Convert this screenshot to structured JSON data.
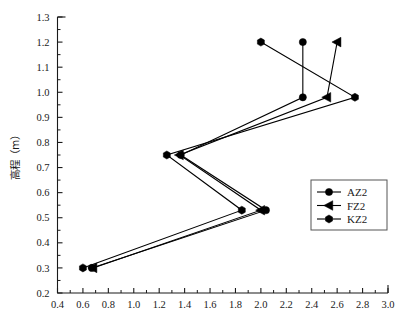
{
  "chart_data": {
    "type": "line",
    "title": "",
    "xlabel": "",
    "ylabel": "高程（m）",
    "xlim": [
      0.4,
      3.0
    ],
    "ylim": [
      0.2,
      1.3
    ],
    "x_ticks": [
      "0.4",
      "0.6",
      "0.8",
      "1.0",
      "1.2",
      "1.4",
      "1.6",
      "1.8",
      "2.0",
      "2.2",
      "2.4",
      "2.6",
      "2.8",
      "3.0"
    ],
    "x_tick_values": [
      0.4,
      0.6,
      0.8,
      1.0,
      1.2,
      1.4,
      1.6,
      1.8,
      2.0,
      2.2,
      2.4,
      2.6,
      2.8,
      3.0
    ],
    "x_minor_step": 0.1,
    "y_ticks": [
      "0.2",
      "0.3",
      "0.4",
      "0.5",
      "0.6",
      "0.7",
      "0.8",
      "0.9",
      "1.0",
      "1.1",
      "1.2",
      "1.3"
    ],
    "y_tick_values": [
      0.2,
      0.3,
      0.4,
      0.5,
      0.6,
      0.7,
      0.8,
      0.9,
      1.0,
      1.1,
      1.2,
      1.3
    ],
    "grid": false,
    "legend_position": "center-right",
    "orientation": "x-is-value-y-is-elevation",
    "series": [
      {
        "name": "AZ2",
        "marker": "circle",
        "color": "#000000",
        "x": [
          0.67,
          2.04,
          1.37,
          2.33,
          2.33
        ],
        "y": [
          0.3,
          0.53,
          0.75,
          0.98,
          1.2
        ]
      },
      {
        "name": "FZ2",
        "marker": "left-triangle",
        "color": "#000000",
        "x": [
          0.68,
          2.0,
          1.36,
          2.52,
          2.6
        ],
        "y": [
          0.3,
          0.53,
          0.75,
          0.98,
          1.2
        ]
      },
      {
        "name": "KZ2",
        "marker": "hexagon",
        "color": "#000000",
        "x": [
          0.6,
          1.85,
          1.26,
          2.74,
          2.0
        ],
        "y": [
          0.3,
          0.53,
          0.75,
          0.98,
          1.2
        ]
      }
    ],
    "legend": [
      {
        "label": "AZ2",
        "marker": "circle"
      },
      {
        "label": "FZ2",
        "marker": "left-triangle"
      },
      {
        "label": "KZ2",
        "marker": "hexagon"
      }
    ]
  }
}
